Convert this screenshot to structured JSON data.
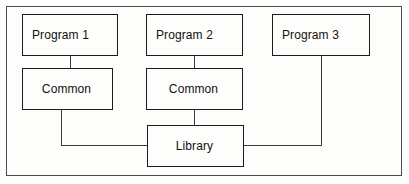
{
  "diagram": {
    "background_color": "#fdfdfb",
    "line_color": "#1c1c1c",
    "frame_color": "#4a4a4a",
    "nodes": [
      {
        "id": "program1",
        "label": "Program 1"
      },
      {
        "id": "program2",
        "label": "Program 2"
      },
      {
        "id": "program3",
        "label": "Program 3"
      },
      {
        "id": "common1",
        "label": "Common"
      },
      {
        "id": "common2",
        "label": "Common"
      },
      {
        "id": "library",
        "label": "Library"
      }
    ],
    "connections": [
      {
        "from": "program1",
        "to": "common1"
      },
      {
        "from": "program2",
        "to": "common2"
      },
      {
        "from": "common1",
        "to": "library"
      },
      {
        "from": "common2",
        "to": "library"
      },
      {
        "from": "program3",
        "to": "library"
      }
    ]
  }
}
